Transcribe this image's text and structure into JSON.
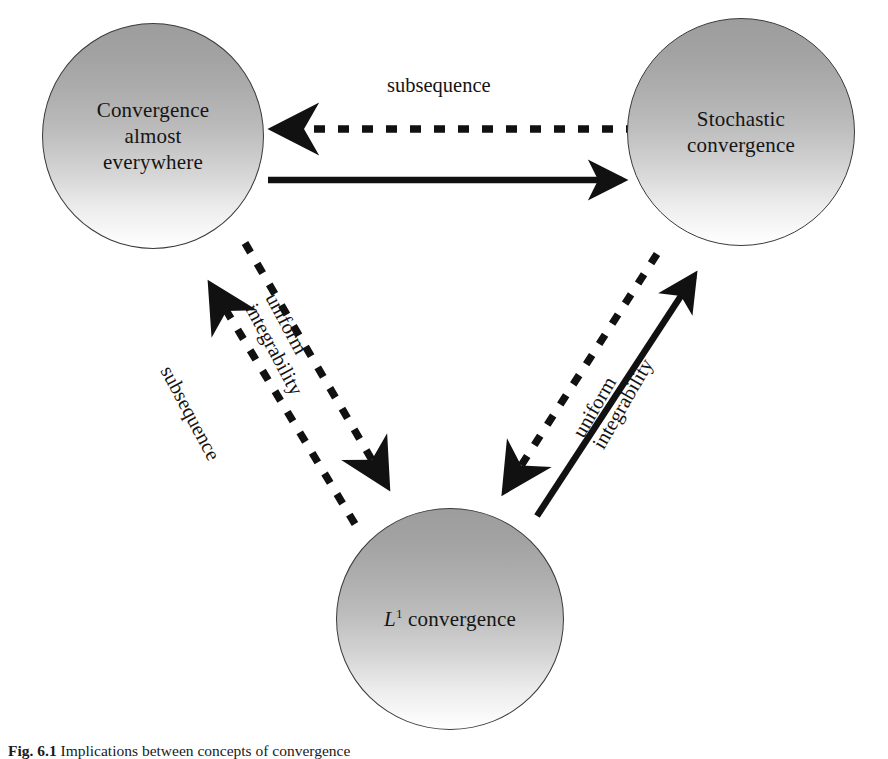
{
  "figure": {
    "caption_label": "Fig. 6.1",
    "caption_text": "Implications between concepts of convergence"
  },
  "nodes": [
    {
      "id": "convergence-almost-everywhere",
      "lines": [
        "Convergence",
        "almost",
        "everywhere"
      ],
      "text": "Convergence almost everywhere",
      "center": [
        153,
        136
      ],
      "radius": 111
    },
    {
      "id": "stochastic-convergence",
      "lines": [
        "Stochastic",
        "convergence"
      ],
      "text": "Stochastic convergence",
      "center": [
        741,
        132
      ],
      "radius": 114
    },
    {
      "id": "l1-convergence",
      "lines": [
        "L1 convergence"
      ],
      "text": "L^1 convergence",
      "symbol": "L",
      "exponent": "1",
      "suffix": " convergence",
      "center": [
        450,
        619
      ],
      "radius": 111
    }
  ],
  "edges": [
    {
      "id": "ae-to-sc",
      "from": "convergence-almost-everywhere",
      "to": "stochastic-convergence",
      "style": "solid",
      "label": ""
    },
    {
      "id": "sc-to-ae",
      "from": "stochastic-convergence",
      "to": "convergence-almost-everywhere",
      "style": "dashed",
      "label": "subsequence"
    },
    {
      "id": "l1-to-ae",
      "from": "l1-convergence",
      "to": "convergence-almost-everywhere",
      "style": "dashed",
      "label": "subsequence"
    },
    {
      "id": "ae-to-l1",
      "from": "convergence-almost-everywhere",
      "to": "l1-convergence",
      "style": "dashed",
      "label_lines": [
        "uniform",
        "integrability"
      ],
      "label": "uniform integrability"
    },
    {
      "id": "sc-to-l1",
      "from": "stochastic-convergence",
      "to": "l1-convergence",
      "style": "dashed",
      "label_lines": [
        "uniform",
        "integrability"
      ],
      "label": "uniform integrability"
    },
    {
      "id": "l1-to-sc",
      "from": "l1-convergence",
      "to": "stochastic-convergence",
      "style": "solid",
      "label": ""
    }
  ],
  "labels": {
    "top_subsequence": "subsequence",
    "left_subsequence": "subsequence",
    "left_uniform": "uniform",
    "left_integrability": "integrability",
    "right_uniform": "uniform",
    "right_integrability": "integrability"
  },
  "colors": {
    "stroke": "#111111",
    "circle_border": "#3a3a3a",
    "gradient_top": "#9d9d9d",
    "gradient_bottom": "#ffffff",
    "background": "#ffffff"
  }
}
